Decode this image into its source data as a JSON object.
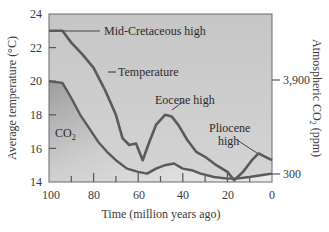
{
  "chart_data": {
    "type": "line",
    "title": "",
    "xlabel": "Time (million years ago)",
    "ylabel": "Average temperature (°C)",
    "y2label": "Atmospheric CO2 (ppm)",
    "xlim": [
      100,
      0
    ],
    "ylim": [
      14,
      24
    ],
    "x_ticks": [
      100,
      80,
      60,
      40,
      20,
      0
    ],
    "x_minor_ticks": [
      90,
      70,
      50,
      30,
      10
    ],
    "y_ticks": [
      14,
      16,
      18,
      20,
      22,
      24
    ],
    "y2_ticks": [
      {
        "label": "3,900",
        "temp_equiv": 20.0
      },
      {
        "label": "300",
        "temp_equiv": 14.5
      }
    ],
    "grid": false,
    "legend": "inline labels",
    "series": [
      {
        "name": "Temperature",
        "axis": "left",
        "x": [
          100,
          94,
          90,
          85,
          80,
          75,
          70,
          67,
          64,
          61,
          58,
          55,
          52,
          48,
          45,
          42,
          38,
          34,
          30,
          25,
          20,
          17,
          13,
          9,
          6,
          3,
          0
        ],
        "values": [
          23.0,
          23.0,
          22.3,
          21.6,
          20.8,
          19.5,
          18.0,
          16.6,
          16.2,
          16.3,
          15.3,
          16.4,
          17.4,
          18.0,
          17.9,
          17.4,
          16.5,
          15.8,
          15.5,
          15.0,
          14.6,
          14.1,
          14.6,
          15.3,
          15.7,
          15.5,
          15.3
        ]
      },
      {
        "name": "CO2",
        "axis": "right",
        "x": [
          100,
          94,
          90,
          86,
          82,
          78,
          74,
          70,
          65,
          60,
          56,
          52,
          48,
          44,
          40,
          36,
          32,
          26,
          20,
          16,
          10,
          5,
          0
        ],
        "values_in_temp_axis_units": [
          20.0,
          19.9,
          19.0,
          18.0,
          17.2,
          16.4,
          15.8,
          15.3,
          14.8,
          14.6,
          14.5,
          14.8,
          15.0,
          15.1,
          14.8,
          14.7,
          14.5,
          14.3,
          14.2,
          14.2,
          14.3,
          14.4,
          14.5
        ]
      }
    ],
    "annotations": [
      {
        "text": "Mid-Cretaceous high",
        "x": 96,
        "y": 23.0
      },
      {
        "text": "Temperature",
        "x": 76,
        "y": 19.5
      },
      {
        "text": "Eocene high",
        "x": 47,
        "y": 18.0
      },
      {
        "text": "Pliocene high",
        "x": 5,
        "y": 15.7
      },
      {
        "text": "CO2",
        "x": 90,
        "y": 17.0
      }
    ]
  },
  "labels": {
    "y_title": "Average temperature (°C)",
    "y2_title_main": "Atmospheric CO",
    "y2_title_sub": "2",
    "y2_title_unit": " (ppm)",
    "x_title": "Time (million years ago)",
    "y_ticks": [
      "24",
      "22",
      "20",
      "18",
      "16",
      "14"
    ],
    "x_ticks": [
      "100",
      "80",
      "60",
      "40",
      "20",
      "0"
    ],
    "y2_ticks": [
      "3,900",
      "300"
    ],
    "annot_cretaceous": "Mid-Cretaceous high",
    "annot_temperature": "Temperature",
    "annot_eocene": "Eocene high",
    "annot_pliocene_1": "Pliocene",
    "annot_pliocene_2": "high",
    "annot_co2_main": "CO",
    "annot_co2_sub": "2"
  },
  "colors": {
    "line": "#5a5a5a",
    "plot_bg_top": "#c8c8c8",
    "plot_bg_bottom": "#d6d6d6",
    "under_co2_dark": "#a8a8a8",
    "under_co2_light": "#e8e8e8"
  }
}
